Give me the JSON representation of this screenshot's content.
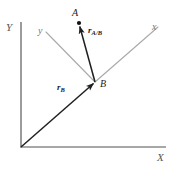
{
  "figure": {
    "type": "vector-diagram",
    "background_color": "#ffffff",
    "width": 176,
    "height": 170
  },
  "colors": {
    "global_axis": "#8a8a8a",
    "local_axis": "#a9a9a9",
    "vector": "#1f1f1f",
    "point": "#111111",
    "label": "#2b2b2b"
  },
  "global_axes": {
    "origin": {
      "x": 21,
      "y": 147
    },
    "y_axis": {
      "label": "Y",
      "from": {
        "x": 21,
        "y": 147
      },
      "to": {
        "x": 21,
        "y": 22
      }
    },
    "x_axis": {
      "label": "X",
      "from": {
        "x": 21,
        "y": 147
      },
      "to": {
        "x": 166,
        "y": 147
      }
    }
  },
  "local_axes": {
    "origin_point": "B",
    "y_axis": {
      "label": "y",
      "from": {
        "x": 95,
        "y": 82
      },
      "to": {
        "x": 46,
        "y": 32
      }
    },
    "x_axis": {
      "label": "x",
      "from": {
        "x": 95,
        "y": 82
      },
      "to": {
        "x": 158,
        "y": 27
      }
    }
  },
  "points": [
    {
      "name": "A",
      "label": "A",
      "x": 79,
      "y": 23,
      "marker": "filled-dot"
    },
    {
      "name": "B",
      "label": "B",
      "x": 95,
      "y": 82,
      "marker": "vertex"
    }
  ],
  "vectors": [
    {
      "name": "r_B",
      "symbol": "r",
      "subscript": "B",
      "from": {
        "x": 21,
        "y": 147
      },
      "to": {
        "x": 95,
        "y": 82
      },
      "arrowhead": "to",
      "description": "position vector of B from global origin"
    },
    {
      "name": "r_A/B",
      "symbol": "r",
      "subscript": "A/B",
      "from": {
        "x": 95,
        "y": 82
      },
      "to": {
        "x": 79,
        "y": 24
      },
      "arrowhead": "to",
      "description": "position vector of A relative to B"
    }
  ]
}
